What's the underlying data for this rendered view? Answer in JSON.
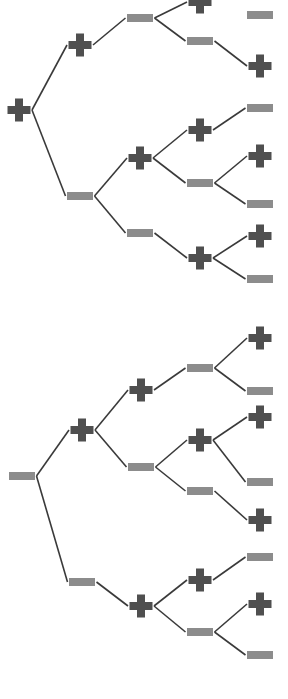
{
  "figure": {
    "title": "",
    "background_color": "#ffffff",
    "width": 288,
    "height": 699,
    "plus_color": "#4f4f4f",
    "minus_color": "#8c8c8c",
    "edge_color": "#3a3a3a",
    "edge_width": 1.6,
    "plus_size": 23,
    "plus_arm": 8,
    "minus_width": 26,
    "minus_height": 8
  },
  "chart_data": {
    "type": "diagram",
    "subtype": "binary-decision-tree-dendrogram",
    "title": "",
    "xlabel": "",
    "ylabel": "",
    "legend": [
      {
        "symbol": "plus",
        "label": "+",
        "color": "#4f4f4f"
      },
      {
        "symbol": "minus",
        "label": "−",
        "color": "#8c8c8c"
      }
    ],
    "trees": [
      {
        "name": "tree-1",
        "root": "t1-n0",
        "nodes": [
          {
            "id": "t1-n0",
            "symbol": "plus",
            "x": 19,
            "y": 110,
            "depth": 0
          },
          {
            "id": "t1-n1",
            "symbol": "plus",
            "x": 80,
            "y": 45,
            "depth": 1
          },
          {
            "id": "t1-n2",
            "symbol": "minus",
            "x": 80,
            "y": 196,
            "depth": 1
          },
          {
            "id": "t1-n3",
            "symbol": "minus",
            "x": 140,
            "y": 18,
            "depth": 2
          },
          {
            "id": "t1-n4",
            "symbol": "plus",
            "x": 140,
            "y": 158,
            "depth": 2
          },
          {
            "id": "t1-n5",
            "symbol": "minus",
            "x": 140,
            "y": 233,
            "depth": 2
          },
          {
            "id": "t1-n6",
            "symbol": "plus",
            "x": 200,
            "y": 2,
            "depth": 3
          },
          {
            "id": "t1-n7",
            "symbol": "minus",
            "x": 200,
            "y": 41,
            "depth": 3
          },
          {
            "id": "t1-n8",
            "symbol": "plus",
            "x": 200,
            "y": 130,
            "depth": 3
          },
          {
            "id": "t1-n9",
            "symbol": "minus",
            "x": 200,
            "y": 183,
            "depth": 3
          },
          {
            "id": "t1-n10",
            "symbol": "plus",
            "x": 200,
            "y": 258,
            "depth": 3
          },
          {
            "id": "t1-n11",
            "symbol": "minus",
            "x": 260,
            "y": 15,
            "depth": 4
          },
          {
            "id": "t1-n12",
            "symbol": "plus",
            "x": 260,
            "y": 66,
            "depth": 4
          },
          {
            "id": "t1-n13",
            "symbol": "minus",
            "x": 260,
            "y": 108,
            "depth": 4
          },
          {
            "id": "t1-n14",
            "symbol": "plus",
            "x": 260,
            "y": 156,
            "depth": 4
          },
          {
            "id": "t1-n15",
            "symbol": "minus",
            "x": 260,
            "y": 204,
            "depth": 4
          },
          {
            "id": "t1-n16",
            "symbol": "plus",
            "x": 260,
            "y": 236,
            "depth": 4
          },
          {
            "id": "t1-n17",
            "symbol": "minus",
            "x": 260,
            "y": 279,
            "depth": 4
          }
        ],
        "edges": [
          [
            "t1-n0",
            "t1-n1"
          ],
          [
            "t1-n0",
            "t1-n2"
          ],
          [
            "t1-n1",
            "t1-n3"
          ],
          [
            "t1-n2",
            "t1-n4"
          ],
          [
            "t1-n2",
            "t1-n5"
          ],
          [
            "t1-n3",
            "t1-n6"
          ],
          [
            "t1-n3",
            "t1-n7"
          ],
          [
            "t1-n4",
            "t1-n8"
          ],
          [
            "t1-n4",
            "t1-n9"
          ],
          [
            "t1-n5",
            "t1-n10"
          ],
          [
            "t1-n7",
            "t1-n12"
          ],
          [
            "t1-n8",
            "t1-n13"
          ],
          [
            "t1-n9",
            "t1-n14"
          ],
          [
            "t1-n9",
            "t1-n15"
          ],
          [
            "t1-n10",
            "t1-n16"
          ],
          [
            "t1-n10",
            "t1-n17"
          ]
        ]
      },
      {
        "name": "tree-2",
        "root": "t2-n0",
        "nodes": [
          {
            "id": "t2-n0",
            "symbol": "minus",
            "x": 22,
            "y": 476,
            "depth": 0
          },
          {
            "id": "t2-n1",
            "symbol": "plus",
            "x": 82,
            "y": 430,
            "depth": 1
          },
          {
            "id": "t2-n2",
            "symbol": "minus",
            "x": 82,
            "y": 582,
            "depth": 1
          },
          {
            "id": "t2-n3",
            "symbol": "plus",
            "x": 141,
            "y": 390,
            "depth": 2
          },
          {
            "id": "t2-n4",
            "symbol": "minus",
            "x": 141,
            "y": 467,
            "depth": 2
          },
          {
            "id": "t2-n5",
            "symbol": "plus",
            "x": 141,
            "y": 606,
            "depth": 2
          },
          {
            "id": "t2-n6",
            "symbol": "minus",
            "x": 200,
            "y": 368,
            "depth": 3
          },
          {
            "id": "t2-n7",
            "symbol": "plus",
            "x": 200,
            "y": 440,
            "depth": 3
          },
          {
            "id": "t2-n8",
            "symbol": "minus",
            "x": 200,
            "y": 491,
            "depth": 3
          },
          {
            "id": "t2-n9",
            "symbol": "plus",
            "x": 200,
            "y": 580,
            "depth": 3
          },
          {
            "id": "t2-n10",
            "symbol": "minus",
            "x": 200,
            "y": 632,
            "depth": 3
          },
          {
            "id": "t2-n11",
            "symbol": "plus",
            "x": 260,
            "y": 338,
            "depth": 4
          },
          {
            "id": "t2-n12",
            "symbol": "minus",
            "x": 260,
            "y": 391,
            "depth": 4
          },
          {
            "id": "t2-n13",
            "symbol": "plus",
            "x": 260,
            "y": 417,
            "depth": 4
          },
          {
            "id": "t2-n14",
            "symbol": "minus",
            "x": 260,
            "y": 482,
            "depth": 4
          },
          {
            "id": "t2-n15",
            "symbol": "plus",
            "x": 260,
            "y": 520,
            "depth": 4
          },
          {
            "id": "t2-n16",
            "symbol": "minus",
            "x": 260,
            "y": 557,
            "depth": 4
          },
          {
            "id": "t2-n17",
            "symbol": "plus",
            "x": 260,
            "y": 604,
            "depth": 4
          },
          {
            "id": "t2-n18",
            "symbol": "minus",
            "x": 260,
            "y": 655,
            "depth": 4
          }
        ],
        "edges": [
          [
            "t2-n0",
            "t2-n1"
          ],
          [
            "t2-n0",
            "t2-n2"
          ],
          [
            "t2-n1",
            "t2-n3"
          ],
          [
            "t2-n1",
            "t2-n4"
          ],
          [
            "t2-n2",
            "t2-n5"
          ],
          [
            "t2-n3",
            "t2-n6"
          ],
          [
            "t2-n4",
            "t2-n7"
          ],
          [
            "t2-n4",
            "t2-n8"
          ],
          [
            "t2-n5",
            "t2-n9"
          ],
          [
            "t2-n5",
            "t2-n10"
          ],
          [
            "t2-n6",
            "t2-n11"
          ],
          [
            "t2-n6",
            "t2-n12"
          ],
          [
            "t2-n7",
            "t2-n13"
          ],
          [
            "t2-n7",
            "t2-n14"
          ],
          [
            "t2-n8",
            "t2-n15"
          ],
          [
            "t2-n9",
            "t2-n16"
          ],
          [
            "t2-n10",
            "t2-n17"
          ],
          [
            "t2-n10",
            "t2-n18"
          ]
        ]
      }
    ]
  }
}
